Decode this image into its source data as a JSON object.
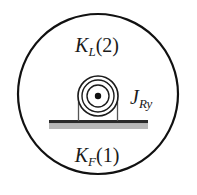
{
  "diagram": {
    "title_visible": false,
    "background_color": "#ffffff",
    "outer_boundary": {
      "shape": "circle",
      "center_x": 98,
      "center_y": 94,
      "radius": 80,
      "stroke_color": "#111111",
      "stroke_width": 2.2,
      "fill_color": "#ffffff"
    },
    "labels": {
      "top": {
        "full_text": "KL(2)",
        "base": "K",
        "subscript": "L",
        "paren": "(2)",
        "x": 97,
        "y": 52
      },
      "right": {
        "full_text": "JRy",
        "base": "J",
        "subscript": "Ry",
        "x": 130,
        "y": 104
      },
      "bottom": {
        "full_text": "KF(1)",
        "base": "K",
        "subscript": "F",
        "paren": "(1)",
        "x": 97,
        "y": 162
      }
    },
    "roller": {
      "name": "rotor-roller",
      "center_x": 98,
      "center_y": 96,
      "ring_radii": [
        20,
        16,
        11
      ],
      "hub_dot_radius": 3.2,
      "stroke_color": "#1a1a1a",
      "stroke_width": 1.5,
      "fill_color": "#ffffff"
    },
    "mount": {
      "name": "bearing-mount",
      "left_x": 78,
      "right_x": 118,
      "top_y": 96,
      "bottom_y": 121,
      "stroke_color": "#4a4a4a",
      "stroke_width": 1.2
    },
    "ground": {
      "name": "ground-base",
      "x": 49,
      "y": 120,
      "width": 99,
      "dark_band_height": 3.2,
      "gray_band_height": 5.5,
      "dark_color": "#2a2a2a",
      "gray_color": "#b8b8b8"
    },
    "colors": {
      "ink": "#111111",
      "mid_gray": "#4a4a4a",
      "light_gray": "#b8b8b8",
      "paper": "#ffffff"
    }
  }
}
